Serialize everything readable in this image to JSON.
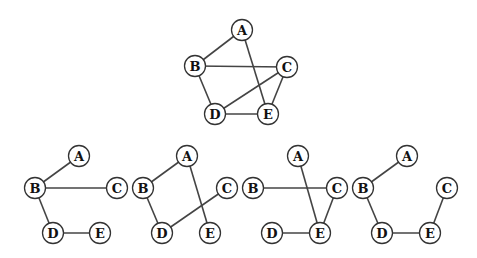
{
  "colors": {
    "edge": "#444444",
    "node_stroke": "#333333",
    "node_fill": "#ffffff",
    "label": "#111111"
  },
  "graphs": [
    {
      "id": "original-graph",
      "nodes": [
        "A",
        "B",
        "C",
        "D",
        "E"
      ],
      "edges": [
        [
          "A",
          "B"
        ],
        [
          "A",
          "E"
        ],
        [
          "B",
          "C"
        ],
        [
          "B",
          "D"
        ],
        [
          "C",
          "D"
        ],
        [
          "C",
          "E"
        ],
        [
          "D",
          "E"
        ]
      ]
    },
    {
      "id": "spanning-tree-1",
      "nodes": [
        "A",
        "B",
        "C",
        "D",
        "E"
      ],
      "edges": [
        [
          "A",
          "B"
        ],
        [
          "B",
          "C"
        ],
        [
          "B",
          "D"
        ],
        [
          "D",
          "E"
        ]
      ]
    },
    {
      "id": "spanning-tree-2",
      "nodes": [
        "A",
        "B",
        "C",
        "D",
        "E"
      ],
      "edges": [
        [
          "A",
          "B"
        ],
        [
          "A",
          "E"
        ],
        [
          "B",
          "D"
        ],
        [
          "C",
          "D"
        ]
      ]
    },
    {
      "id": "spanning-tree-3",
      "nodes": [
        "A",
        "B",
        "C",
        "D",
        "E"
      ],
      "edges": [
        [
          "A",
          "E"
        ],
        [
          "B",
          "C"
        ],
        [
          "C",
          "E"
        ],
        [
          "D",
          "E"
        ]
      ]
    },
    {
      "id": "spanning-tree-4",
      "nodes": [
        "A",
        "B",
        "C",
        "D",
        "E"
      ],
      "edges": [
        [
          "A",
          "B"
        ],
        [
          "B",
          "D"
        ],
        [
          "D",
          "E"
        ],
        [
          "C",
          "E"
        ]
      ]
    }
  ]
}
